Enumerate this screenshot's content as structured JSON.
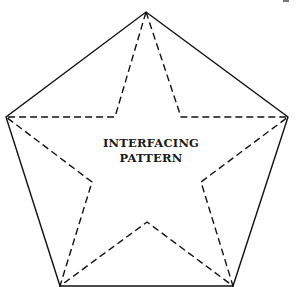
{
  "diagram": {
    "label_line1": "INTERFACING",
    "label_line2": "PATTERN",
    "stroke_color": "#111111",
    "pentagon": {
      "style": "solid",
      "points": [
        [
          146,
          12
        ],
        [
          288,
          117
        ],
        [
          233,
          286
        ],
        [
          60,
          286
        ],
        [
          6,
          117
        ]
      ]
    },
    "star": {
      "style": "dashed",
      "points": [
        [
          146,
          12
        ],
        [
          181,
          117
        ],
        [
          288,
          117
        ],
        [
          201,
          182
        ],
        [
          233,
          286
        ],
        [
          147,
          222
        ],
        [
          60,
          286
        ],
        [
          92,
          182
        ],
        [
          6,
          117
        ],
        [
          115,
          117
        ]
      ]
    }
  }
}
